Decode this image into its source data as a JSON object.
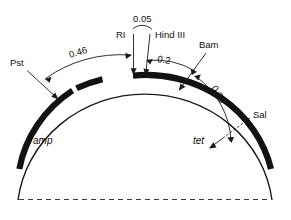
{
  "figure": {
    "background_color": "#ffffff",
    "line_color": "#1a1a1a",
    "arc_color": "#121212"
  },
  "genes": [
    {
      "id": "amp",
      "label": "amp"
    },
    {
      "id": "tet",
      "label": "tet"
    }
  ],
  "restriction_sites": [
    {
      "id": "pst",
      "label": "Pst"
    },
    {
      "id": "ri",
      "label": "RI"
    },
    {
      "id": "hind3",
      "label": "Hind III"
    },
    {
      "id": "bam",
      "label": "Bam"
    },
    {
      "id": "sal",
      "label": "Sal"
    }
  ],
  "distances": [
    {
      "id": "d046",
      "label": "0.46"
    },
    {
      "id": "d005",
      "label": "0.05"
    },
    {
      "id": "d02",
      "label": "0.2"
    },
    {
      "id": "d035",
      "label": "0.35"
    }
  ]
}
